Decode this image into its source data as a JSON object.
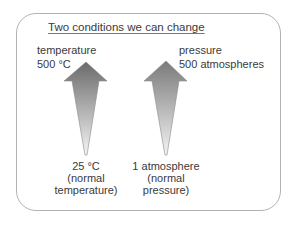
{
  "title": "Two conditions we can change",
  "conditions": [
    {
      "name": "temperature",
      "high_value": "500 °C",
      "low_value": "25 °C",
      "low_note_line1": "(normal",
      "low_note_line2": "temperature)"
    },
    {
      "name": "pressure",
      "high_value": "500 atmospheres",
      "low_value": "1 atmosphere",
      "low_note_line1": "(normal",
      "low_note_line2": "pressure)"
    }
  ],
  "colors": {
    "border": "#b3b3b3",
    "arrow_dark": "#6f6f6f",
    "arrow_light": "#f2f2f2",
    "text": "#3a3a3a"
  }
}
